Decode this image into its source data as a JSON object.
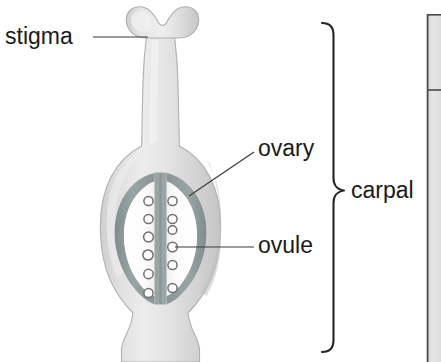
{
  "figure": {
    "type": "botanical-diagram",
    "background_color": "#ffffff"
  },
  "labels": {
    "stigma": "stigma",
    "ovary": "ovary",
    "ovule": "ovule",
    "carpal": "carpal"
  },
  "colors": {
    "text": "#1a1a1a",
    "leader_line": "#3a3a3a",
    "brace": "#252525",
    "carpal_body_light": "#e2e2e2",
    "carpal_body_mid": "#d2d2d2",
    "carpal_body_edge": "#b8b8b8",
    "locule_wall": "#8e9a9a",
    "locule_fill": "#fbfbfb",
    "ovule_stroke": "#6e6e6e",
    "ovule_fill": "#ffffff",
    "panel_fill": "#e0e0e0",
    "panel_border": "#4a4a4a"
  },
  "structure": {
    "ovule_count_left": 6,
    "ovule_count_right": 6,
    "ovule_count_total": 12,
    "locule_count": 2,
    "stigma_lobes": 2
  },
  "side_panel": {
    "visible": "partial",
    "description": "cut-off panel at right edge"
  }
}
